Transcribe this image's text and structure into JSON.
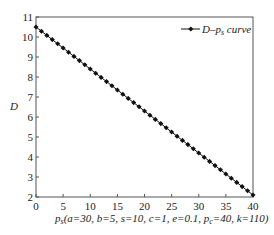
{
  "chart_data": {
    "type": "line",
    "title": "",
    "xlabel": "ps(a=30, b=5, s=10, c=1, e=0.1, pc=40, k=110)",
    "xlabel_parts": {
      "var": "p",
      "var_sub": "s",
      "params_before": "(a=30, b=5, s=10, c=1, e=0.1, ",
      "pc_var": "p",
      "pc_sub": "c",
      "params_after": "=40, k=110)"
    },
    "ylabel": "D",
    "xlim": [
      0,
      40
    ],
    "ylim": [
      2,
      11
    ],
    "xticks": [
      0,
      5,
      10,
      15,
      20,
      25,
      30,
      35,
      40
    ],
    "yticks": [
      2,
      3,
      4,
      5,
      6,
      7,
      8,
      9,
      10,
      11
    ],
    "grid": false,
    "legend_position": "upper right",
    "series": [
      {
        "name": "D–ps curve",
        "legend_parts": {
          "a": "D–",
          "b": "p",
          "sub": "s",
          "c": " curve"
        },
        "marker": "star",
        "color": "#111111",
        "x": [
          0,
          1,
          2,
          3,
          4,
          5,
          6,
          7,
          8,
          9,
          10,
          11,
          12,
          13,
          14,
          15,
          16,
          17,
          18,
          19,
          20,
          21,
          22,
          23,
          24,
          25,
          26,
          27,
          28,
          29,
          30,
          31,
          32,
          33,
          34,
          35,
          36,
          37,
          38,
          39,
          40
        ],
        "values": [
          10.5,
          10.29,
          10.08,
          9.87,
          9.66,
          9.45,
          9.24,
          9.03,
          8.82,
          8.61,
          8.4,
          8.19,
          7.98,
          7.77,
          7.56,
          7.35,
          7.14,
          6.93,
          6.72,
          6.51,
          6.3,
          6.09,
          5.88,
          5.67,
          5.46,
          5.25,
          5.04,
          4.83,
          4.62,
          4.41,
          4.2,
          3.99,
          3.78,
          3.57,
          3.36,
          3.15,
          2.94,
          2.73,
          2.52,
          2.31,
          2.1
        ]
      }
    ]
  },
  "colors": {
    "line": "#111111",
    "axis": "#555555",
    "background": "#ffffff"
  }
}
